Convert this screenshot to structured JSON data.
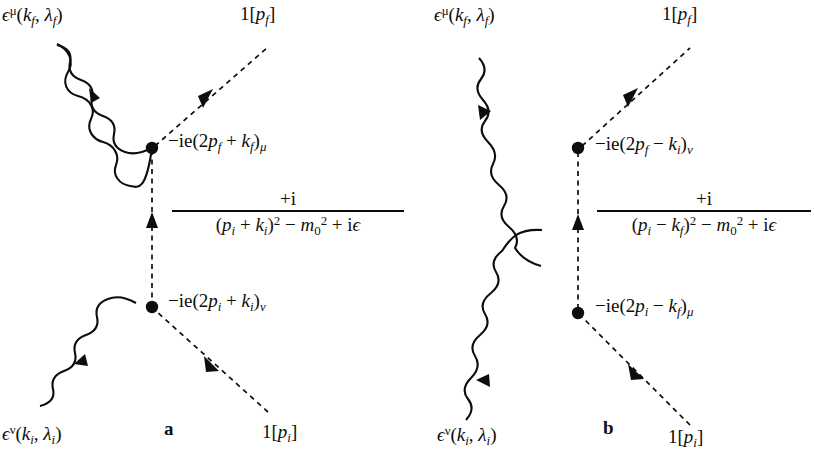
{
  "figure": {
    "type": "feynman-diagram-pair",
    "background_color": "#ffffff",
    "line_color": "#0d0d0d"
  },
  "diagram_a": {
    "caption": "a",
    "external_legs": {
      "photon_out_top_left": "ϵμ(kf, λf)",
      "scalar_out_top_right": "1[pf]",
      "photon_in_bottom_left": "ϵν(ki, λi)",
      "scalar_in_bottom_right": "1[pi]"
    },
    "labels": {
      "photon_final": {
        "eps": "ϵ",
        "eps_sup": "μ",
        "open": "(",
        "k": "k",
        "k_sub": "f",
        "comma": ", ",
        "lambda": "λ",
        "lambda_sub": "f",
        "close": ")"
      },
      "photon_initial": {
        "eps": "ϵ",
        "eps_sup": "ν",
        "open": "(",
        "k": "k",
        "k_sub": "i",
        "comma": ", ",
        "lambda": "λ",
        "lambda_sub": "i",
        "close": ")"
      },
      "scalar_final": {
        "one": "1[",
        "p": "p",
        "p_sub": "f",
        "close": "]"
      },
      "scalar_initial": {
        "one": "1[",
        "p": "p",
        "p_sub": "i",
        "close": "]"
      }
    },
    "vertex_upper": {
      "prefix": "−ie(2",
      "p": "p",
      "p_sub": "f",
      "op": " + ",
      "k": "k",
      "k_sub": "f",
      "close": ")",
      "index": "μ"
    },
    "vertex_lower": {
      "prefix": "−ie(2",
      "p": "p",
      "p_sub": "i",
      "op": " + ",
      "k": "k",
      "k_sub": "i",
      "close": ")",
      "index": "ν"
    },
    "propagator": {
      "numerator": "+i",
      "den_open": "(",
      "den_p": "p",
      "den_p_sub": "i",
      "den_op": " + ",
      "den_k": "k",
      "den_k_sub": "i",
      "den_close": ")",
      "den_sq": "2",
      "den_minus": " − ",
      "den_m": "m",
      "den_m_sub": "0",
      "den_m_sup": "2",
      "den_plus": " + i",
      "den_eps": "ϵ"
    }
  },
  "diagram_b": {
    "caption": "b",
    "external_legs": {
      "photon_out_top_left": "ϵμ(kf, λf)",
      "scalar_out_top_right": "1[pf]",
      "photon_in_bottom_left": "ϵν(ki, λi)",
      "scalar_in_bottom_right": "1[pi]"
    },
    "labels": {
      "photon_final": {
        "eps": "ϵ",
        "eps_sup": "μ",
        "open": "(",
        "k": "k",
        "k_sub": "f",
        "comma": ", ",
        "lambda": "λ",
        "lambda_sub": "f",
        "close": ")"
      },
      "photon_initial": {
        "eps": "ϵ",
        "eps_sup": "ν",
        "open": "(",
        "k": "k",
        "k_sub": "i",
        "comma": ", ",
        "lambda": "λ",
        "lambda_sub": "i",
        "close": ")"
      },
      "scalar_final": {
        "one": "1[",
        "p": "p",
        "p_sub": "f",
        "close": "]"
      },
      "scalar_initial": {
        "one": "1[",
        "p": "p",
        "p_sub": "i",
        "close": "]"
      }
    },
    "vertex_upper": {
      "prefix": "−ie(2",
      "p": "p",
      "p_sub": "f",
      "op": " − ",
      "k": "k",
      "k_sub": "i",
      "close": ")",
      "index": "ν"
    },
    "vertex_lower": {
      "prefix": "−ie(2",
      "p": "p",
      "p_sub": "i",
      "op": " − ",
      "k": "k",
      "k_sub": "f",
      "close": ")",
      "index": "μ"
    },
    "propagator": {
      "numerator": "+i",
      "den_open": "(",
      "den_p": "p",
      "den_p_sub": "i",
      "den_op": " − ",
      "den_k": "k",
      "den_k_sub": "f",
      "den_close": ")",
      "den_sq": "2",
      "den_minus": " − ",
      "den_m": "m",
      "den_m_sub": "0",
      "den_m_sup": "2",
      "den_plus": " + i",
      "den_eps": "ϵ"
    }
  }
}
